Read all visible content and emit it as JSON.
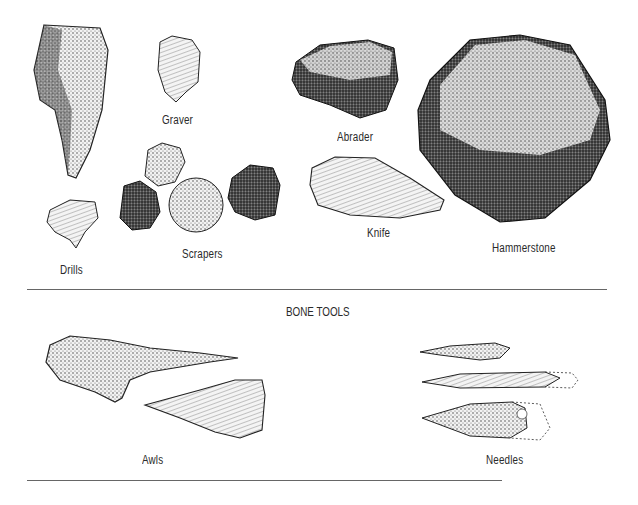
{
  "stone_tools": {
    "labels": {
      "graver": "Graver",
      "abrader": "Abrader",
      "hammerstone": "Hammerstone",
      "knife": "Knife",
      "scrapers": "Scrapers",
      "drills": "Drills"
    }
  },
  "bone_tools": {
    "heading": "BONE TOOLS",
    "labels": {
      "awls": "Awls",
      "needles": "Needles"
    }
  },
  "colors": {
    "ink": "#1a1a1a",
    "rule": "#666666",
    "background": "#ffffff"
  }
}
